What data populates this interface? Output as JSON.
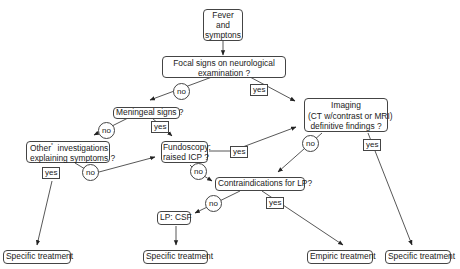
{
  "nodes": {
    "fever": {
      "lines": [
        "Fever",
        "and",
        "symptons"
      ]
    },
    "focal": {
      "lines": [
        "Focal signs on neurological",
        "examination ?"
      ]
    },
    "meningeal": {
      "lines": [
        "Meningeal signs ?"
      ]
    },
    "imaging": {
      "lines": [
        "Imaging",
        "(CT w/contrast or MRI)",
        "definitive findings ?"
      ]
    },
    "other": {
      "lines": [
        "Other",
        "investigations",
        "explaining symptoms ?"
      ],
      "footnote_mark": "*"
    },
    "fundoscopy": {
      "lines": [
        "Fundoscopy:",
        "raised ICP ?"
      ]
    },
    "contraindications": {
      "lines": [
        "Contraindications for LP?"
      ]
    },
    "lp_csf": {
      "lines": [
        "LP: CSF"
      ]
    },
    "specific_1": {
      "lines": [
        "Specific treatment"
      ]
    },
    "specific_2": {
      "lines": [
        "Specific treatment"
      ]
    },
    "empiric": {
      "lines": [
        "Empiric treatment"
      ]
    },
    "specific_3": {
      "lines": [
        "Specific treatment"
      ]
    }
  },
  "edge_labels": {
    "focal_no": "no",
    "focal_yes": "yes",
    "meningeal_no": "no",
    "meningeal_yes": "yes",
    "other_yes": "yes",
    "other_no": "no",
    "fundoscopy_yes": "yes",
    "fundoscopy_no": "no",
    "imaging_no": "no",
    "imaging_yes": "yes",
    "contra_no": "no",
    "contra_yes": "yes"
  },
  "edges": [
    {
      "from": "fever",
      "to": "focal"
    },
    {
      "from": "focal",
      "to": "meningeal",
      "label": "no"
    },
    {
      "from": "focal",
      "to": "imaging",
      "label": "yes"
    },
    {
      "from": "meningeal",
      "to": "other",
      "label": "no"
    },
    {
      "from": "meningeal",
      "to": "fundoscopy",
      "label": "yes"
    },
    {
      "from": "other",
      "to": "specific_1",
      "label": "yes"
    },
    {
      "from": "other",
      "to": "fundoscopy",
      "label": "no"
    },
    {
      "from": "fundoscopy",
      "to": "imaging",
      "label": "yes"
    },
    {
      "from": "fundoscopy",
      "to": "contraindications",
      "label": "no"
    },
    {
      "from": "imaging",
      "to": "contraindications",
      "label": "no"
    },
    {
      "from": "imaging",
      "to": "specific_3",
      "label": "yes"
    },
    {
      "from": "contraindications",
      "to": "lp_csf",
      "label": "no"
    },
    {
      "from": "contraindications",
      "to": "empiric",
      "label": "yes"
    },
    {
      "from": "lp_csf",
      "to": "specific_2"
    }
  ],
  "colors": {
    "stroke": "#444444",
    "text": "#222222",
    "background": "#ffffff"
  }
}
